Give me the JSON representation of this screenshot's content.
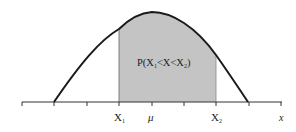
{
  "diagram": {
    "type": "normal-distribution-area",
    "region_label": "P(X₁<X<X₂)",
    "region_label_parts": {
      "p": "P(X",
      "sub1": "1",
      "mid": "<X<X",
      "sub2": "2",
      "end": ")"
    },
    "axis_labels": {
      "x1": {
        "main": "X",
        "sub": "1"
      },
      "mu": "μ",
      "x2": {
        "main": "X",
        "sub": "2"
      },
      "axis_var": "x"
    },
    "colors": {
      "shade": "#c4c4c4",
      "curve": "#1a1a1a",
      "axis": "#333333"
    }
  }
}
